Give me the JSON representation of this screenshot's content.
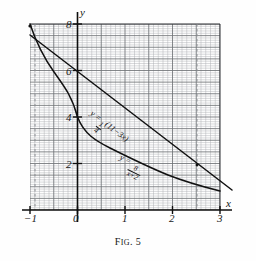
{
  "figure": {
    "caption_prefix": "F",
    "caption_small": "IG",
    "caption_suffix": ". 5",
    "caption_full": "Fig. 5"
  },
  "axes": {
    "x_axis_name": "x",
    "y_axis_name": "y",
    "x_ticks": [
      {
        "value": -1,
        "label": "−1"
      },
      {
        "value": 0,
        "label": "0"
      },
      {
        "value": 1,
        "label": "1"
      },
      {
        "value": 2,
        "label": "2"
      },
      {
        "value": 3,
        "label": "3"
      }
    ],
    "y_ticks": [
      {
        "value": 2,
        "label": "2"
      },
      {
        "value": 4,
        "label": "4"
      },
      {
        "value": 6,
        "label": "6"
      },
      {
        "value": 8,
        "label": "8"
      }
    ],
    "xlim": [
      -1,
      3
    ],
    "ylim": [
      0,
      8
    ],
    "grid": "graph-paper",
    "grid_minor_step": 0.1,
    "grid_major_step": 0.5,
    "grid_color": "#6f7276",
    "grid_minor_color": "#a9acb0",
    "axis_color": "#101010"
  },
  "labels": {
    "line_label": {
      "lhs": "y =",
      "frac_num": "1",
      "frac_den": "4",
      "rhs": "(11−3x)",
      "plain": "y = 1/4 (11−3x)"
    },
    "hyperbola_label": {
      "lhs": "y =",
      "frac_num": "8",
      "frac_den": "x+2",
      "plain": "y = 8/(x+2)"
    }
  },
  "chart_data": {
    "type": "line",
    "title": "Fig. 5",
    "xlabel": "x",
    "ylabel": "y",
    "xlim": [
      -1,
      3
    ],
    "ylim": [
      0,
      8
    ],
    "grid": true,
    "legend": "inline-curve-labels",
    "series": [
      {
        "name": "y = 1/4 (11−3x)",
        "type": "line",
        "x": [
          -1,
          0,
          1,
          2,
          3
        ],
        "values": [
          3.5,
          2.75,
          2.0,
          1.25,
          0.5
        ],
        "drawn_x": [
          -1,
          0,
          1,
          2,
          2.4,
          3
        ],
        "drawn_values": [
          7.5,
          5.55,
          4.0,
          2.55,
          1.95,
          1.6
        ],
        "slope": -1.47,
        "intercept": 5.55
      },
      {
        "name": "y = 8/(x+2)",
        "type": "line",
        "x": [
          -1,
          -0.5,
          0,
          0.5,
          1,
          1.5,
          2,
          2.5,
          3
        ],
        "values": [
          8.0,
          5.33,
          4.0,
          3.2,
          2.67,
          2.29,
          2.0,
          1.78,
          1.6
        ]
      }
    ],
    "intersections": [
      {
        "x": -1,
        "y": 8.0
      },
      {
        "x": 2.4,
        "y": 1.95
      }
    ],
    "annotations": [
      {
        "kind": "dashed-vertical",
        "x": -0.9
      },
      {
        "kind": "dashed-vertical",
        "x": 2.42
      }
    ]
  }
}
